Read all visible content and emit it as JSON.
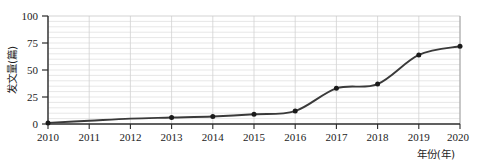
{
  "chart_data": {
    "type": "line",
    "title": "",
    "xlabel": "年份(年)",
    "ylabel": "发文量(篇)",
    "categories": [
      "2010",
      "2011",
      "2012",
      "2013",
      "2014",
      "2015",
      "2016",
      "2017",
      "2018",
      "2019",
      "2020"
    ],
    "x": [
      2010,
      2011,
      2012,
      2013,
      2014,
      2015,
      2016,
      2017,
      2018,
      2019,
      2020
    ],
    "values": [
      1,
      3,
      5,
      6,
      7,
      9,
      12,
      33,
      37,
      64,
      72
    ],
    "series": [
      {
        "name": "发文量",
        "values": [
          1,
          3,
          5,
          6,
          7,
          9,
          12,
          33,
          37,
          64,
          72
        ]
      }
    ],
    "xlim": [
      2009.6,
      2020.5
    ],
    "ylim": [
      0,
      100
    ],
    "ytick_labels": [
      "0",
      "25",
      "50",
      "75",
      "100"
    ],
    "yticks": [
      0,
      25,
      50,
      75,
      100
    ],
    "y_minor_step": 5,
    "grid": "horizontal-minor-and-vertical-major",
    "legend": "none",
    "line_color": "#3a3a3a",
    "marker": "circle",
    "marker_color": "#1a1a1a",
    "gridline_color": "#d9d9d9",
    "axis_color": "#2b2b2b",
    "background_color": "#ffffff",
    "smoothing": "spline"
  },
  "axes": {
    "y_tick_0": "0",
    "y_tick_1": "25",
    "y_tick_2": "50",
    "y_tick_3": "75",
    "y_tick_4": "100",
    "x_tick_0": "2010",
    "x_tick_1": "2011",
    "x_tick_2": "2012",
    "x_tick_3": "2013",
    "x_tick_4": "2014",
    "x_tick_5": "2015",
    "x_tick_6": "2016",
    "x_tick_7": "2017",
    "x_tick_8": "2018",
    "x_tick_9": "2019",
    "x_tick_10": "2020",
    "x_axis_title": "年份(年)",
    "y_axis_title": "发文量(篇)"
  }
}
